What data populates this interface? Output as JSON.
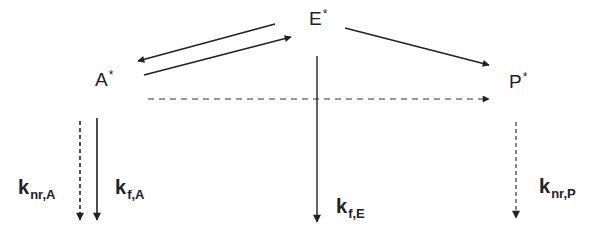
{
  "diagram": {
    "type": "kinetic-scheme",
    "states": [
      {
        "id": "A",
        "symbol": "A",
        "mark": "*"
      },
      {
        "id": "E",
        "symbol": "E",
        "mark": "*"
      },
      {
        "id": "P",
        "symbol": "P",
        "mark": "*"
      }
    ],
    "transitions": [
      {
        "from": "E",
        "to": "A",
        "style": "solid"
      },
      {
        "from": "A",
        "to": "E",
        "style": "solid"
      },
      {
        "from": "E",
        "to": "P",
        "style": "solid"
      },
      {
        "from": "A",
        "to": "P",
        "style": "dashed"
      },
      {
        "from": "A",
        "to": "ground",
        "style": "dashed",
        "label": "knr,A"
      },
      {
        "from": "A",
        "to": "ground",
        "style": "solid",
        "label": "kf,A"
      },
      {
        "from": "E",
        "to": "ground",
        "style": "solid",
        "label": "kf,E"
      },
      {
        "from": "P",
        "to": "ground",
        "style": "dashed",
        "label": "knr,P"
      }
    ],
    "rates": {
      "knrA": {
        "base": "k",
        "sub": "nr,A"
      },
      "kfA": {
        "base": "k",
        "sub": "f,A"
      },
      "kfE": {
        "base": "k",
        "sub": "f,E"
      },
      "knrP": {
        "base": "k",
        "sub": "nr,P"
      }
    },
    "colors": {
      "line": "#222222",
      "background": "#ffffff"
    }
  }
}
